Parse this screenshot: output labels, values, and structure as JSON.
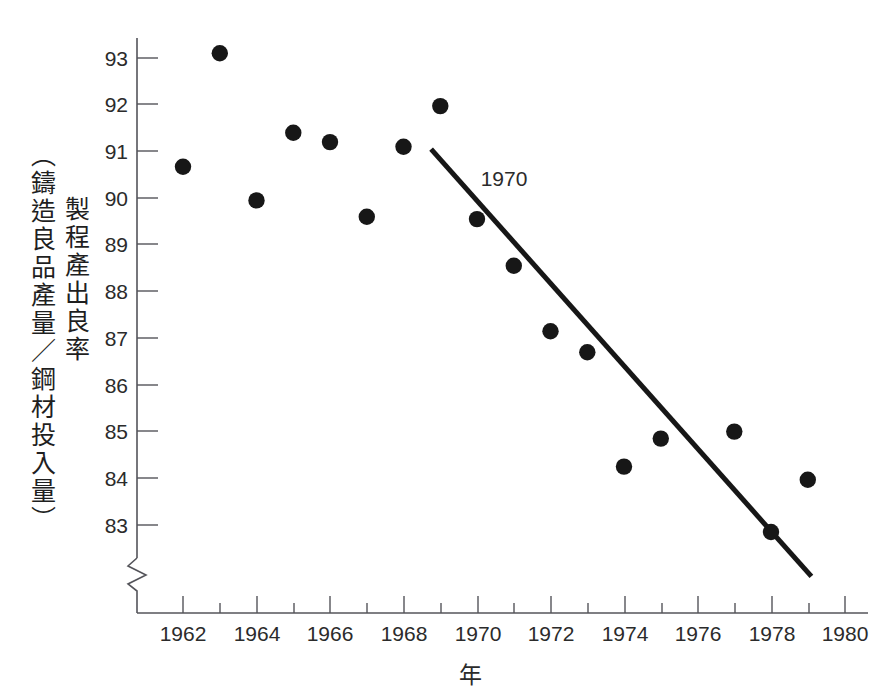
{
  "figure": {
    "top_cut_text": "……………",
    "y_axis": {
      "title_inner": "製程產出良率",
      "title_outer": "（鑄造良品產量／鋼材投入量）",
      "ticks": [
        93,
        92,
        91,
        90,
        89,
        88,
        87,
        86,
        85,
        84,
        83
      ],
      "has_axis_break": true,
      "break_icon": "axis-break-zigzag"
    },
    "x_axis": {
      "title": "年",
      "major_ticks": [
        1962,
        1964,
        1966,
        1968,
        1970,
        1972,
        1974,
        1976,
        1978,
        1980
      ],
      "minor_ticks": [
        1963,
        1965,
        1967,
        1969,
        1971,
        1973,
        1975,
        1977,
        1979
      ]
    },
    "annotations": [
      {
        "text": "1970",
        "x": 1970.1,
        "y": 90.25
      }
    ],
    "colors": {
      "marker": "#171717",
      "trend_line": "#171717",
      "axis": "#54545a",
      "text": "#2b2b2b",
      "background": "#ffffff"
    }
  },
  "chart_data": {
    "type": "scatter",
    "title": "",
    "subtitle": "",
    "xlabel": "年",
    "ylabel": "製程產出良率（鑄造良品產量／鋼材投入量）",
    "xlim": [
      1961,
      1980.6
    ],
    "ylim": [
      82.35,
      93.45
    ],
    "y_axis_broken_below": 82.35,
    "grid": false,
    "legend": null,
    "x": [
      1962,
      1963,
      1964,
      1965,
      1966,
      1967,
      1968,
      1969,
      1970,
      1971,
      1972,
      1973,
      1974,
      1975,
      1977,
      1978,
      1979
    ],
    "values": [
      90.67,
      93.1,
      89.95,
      91.4,
      91.2,
      89.6,
      91.1,
      91.97,
      89.55,
      88.55,
      87.15,
      86.7,
      84.25,
      84.85,
      85.0,
      82.85,
      83.97
    ],
    "points": [
      {
        "year": 1962,
        "yield": 90.67
      },
      {
        "year": 1963,
        "yield": 93.1
      },
      {
        "year": 1964,
        "yield": 89.95
      },
      {
        "year": 1965,
        "yield": 91.4
      },
      {
        "year": 1966,
        "yield": 91.2
      },
      {
        "year": 1967,
        "yield": 89.6
      },
      {
        "year": 1968,
        "yield": 91.1
      },
      {
        "year": 1969,
        "yield": 91.97
      },
      {
        "year": 1970,
        "yield": 89.55
      },
      {
        "year": 1971,
        "yield": 88.55
      },
      {
        "year": 1972,
        "yield": 87.15
      },
      {
        "year": 1973,
        "yield": 86.7
      },
      {
        "year": 1974,
        "yield": 84.25
      },
      {
        "year": 1975,
        "yield": 84.85
      },
      {
        "year": 1977,
        "yield": 85.0
      },
      {
        "year": 1978,
        "yield": 82.85
      },
      {
        "year": 1979,
        "yield": 83.97
      }
    ],
    "trend_line": {
      "label": "1970",
      "start": {
        "year": 1968.75,
        "yield": 91.05
      },
      "end": {
        "year": 1979.1,
        "yield": 81.9
      }
    }
  }
}
